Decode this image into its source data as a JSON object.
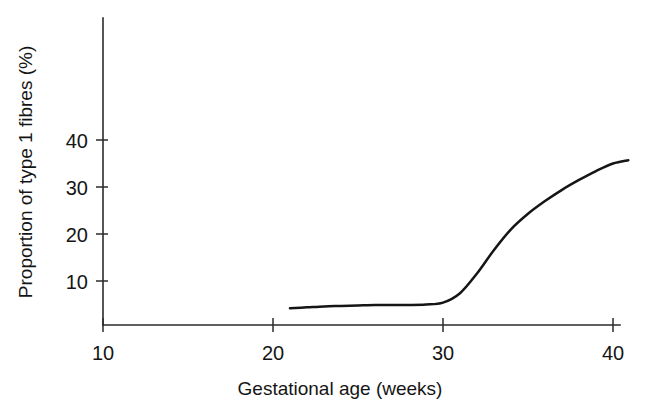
{
  "chart_data": {
    "type": "line",
    "title": "",
    "xlabel": "Gestational age (weeks)",
    "ylabel": "Proportion of type 1 fibres (%)",
    "xlim": [
      10,
      40
    ],
    "ylim": [
      0.6,
      50
    ],
    "grid": false,
    "legend": null,
    "xticks": [
      10,
      20,
      30,
      40
    ],
    "xtick_labels": [
      "10",
      "20",
      "30",
      "40"
    ],
    "yticks": [
      10,
      20,
      30,
      40
    ],
    "ytick_labels": [
      "10",
      "20",
      "30",
      "40"
    ],
    "series": [
      {
        "name": "Proportion of type 1 fibres",
        "color": "#151515",
        "x": [
          21.0,
          22,
          23,
          24,
          25,
          26,
          27,
          28,
          29,
          30,
          31,
          32,
          33,
          34,
          35,
          36,
          37,
          38,
          39,
          40,
          40.9
        ],
        "values": [
          4.2,
          4.4,
          4.6,
          4.7,
          4.8,
          4.9,
          4.9,
          4.9,
          5.0,
          5.4,
          7.4,
          11.6,
          16.6,
          21.0,
          24.3,
          27.0,
          29.4,
          31.5,
          33.4,
          35.0,
          35.7
        ]
      }
    ],
    "annotations": []
  },
  "axis": {
    "x_tick_labels": [
      "10",
      "20",
      "30",
      "40"
    ],
    "y_tick_labels": [
      "40",
      "30",
      "20",
      "10"
    ],
    "x_axis_title": "Gestational age (weeks)",
    "y_axis_title": "Proportion of type 1 fibres (%)"
  },
  "colors": {
    "curve": "#151515",
    "axis": "#2b2b2b",
    "background": "#ffffff"
  }
}
